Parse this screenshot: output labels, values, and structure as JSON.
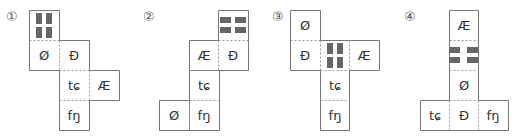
{
  "diagram": {
    "colors": {
      "line": "#777777",
      "stripe": "#666666",
      "text": "#333333"
    },
    "options": [
      {
        "label": "①",
        "cells": [
          {
            "col": 0,
            "row": 0,
            "symbol": "",
            "pattern": "vertical-bars"
          },
          {
            "col": 0,
            "row": 1,
            "symbol": "Ø"
          },
          {
            "col": 1,
            "row": 1,
            "symbol": "Đ"
          },
          {
            "col": 1,
            "row": 2,
            "symbol": "tɕ"
          },
          {
            "col": 2,
            "row": 2,
            "symbol": "Æ"
          },
          {
            "col": 1,
            "row": 3,
            "symbol": "fŋ"
          }
        ]
      },
      {
        "label": "②",
        "cells": [
          {
            "col": 2,
            "row": 0,
            "symbol": "",
            "pattern": "horizontal-bars"
          },
          {
            "col": 1,
            "row": 1,
            "symbol": "Æ"
          },
          {
            "col": 2,
            "row": 1,
            "symbol": "Đ"
          },
          {
            "col": 1,
            "row": 2,
            "symbol": "tɕ"
          },
          {
            "col": 0,
            "row": 3,
            "symbol": "Ø"
          },
          {
            "col": 1,
            "row": 3,
            "symbol": "fŋ"
          }
        ]
      },
      {
        "label": "③",
        "cells": [
          {
            "col": 0,
            "row": 0,
            "symbol": "Ø"
          },
          {
            "col": 0,
            "row": 1,
            "symbol": "Đ"
          },
          {
            "col": 1,
            "row": 1,
            "symbol": "",
            "pattern": "vertical-bars"
          },
          {
            "col": 2,
            "row": 1,
            "symbol": "Æ"
          },
          {
            "col": 1,
            "row": 2,
            "symbol": "tɕ"
          },
          {
            "col": 1,
            "row": 3,
            "symbol": "fŋ"
          }
        ]
      },
      {
        "label": "④",
        "cells": [
          {
            "col": 1,
            "row": 0,
            "symbol": "Æ"
          },
          {
            "col": 1,
            "row": 1,
            "symbol": "",
            "pattern": "horizontal-bars"
          },
          {
            "col": 1,
            "row": 2,
            "symbol": "Ø"
          },
          {
            "col": 0,
            "row": 3,
            "symbol": "tɕ"
          },
          {
            "col": 1,
            "row": 3,
            "symbol": "Đ"
          },
          {
            "col": 2,
            "row": 3,
            "symbol": "fŋ"
          }
        ]
      }
    ]
  }
}
